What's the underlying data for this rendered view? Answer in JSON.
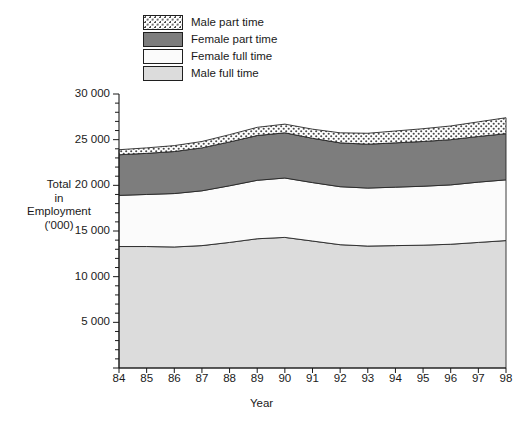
{
  "chart_data": {
    "type": "area",
    "stacked": true,
    "title": "",
    "xlabel": "Year",
    "ylabel": "Total in Employment ('000)",
    "ylabel_lines": [
      "Total",
      "in",
      "Employment",
      "('000)"
    ],
    "x": [
      84,
      85,
      86,
      87,
      88,
      89,
      90,
      91,
      92,
      93,
      94,
      95,
      96,
      97,
      98
    ],
    "x_tick_labels": [
      "84",
      "85",
      "86",
      "87",
      "88",
      "89",
      "90",
      "91",
      "92",
      "93",
      "94",
      "95",
      "96",
      "97",
      "98"
    ],
    "xlim": [
      84,
      98
    ],
    "ylim": [
      0,
      30000
    ],
    "y_ticks_major": [
      0,
      5000,
      10000,
      15000,
      20000,
      25000,
      30000
    ],
    "y_tick_labels": [
      "0",
      "5 000",
      "10 000",
      "15 000",
      "20 000",
      "25 000",
      "30 000"
    ],
    "y_minor_tick_step": 1000,
    "grid": false,
    "legend_position": "top-left-outside",
    "series": [
      {
        "name": "Male full time",
        "color": "#dcdcdc",
        "pattern": "solid",
        "values": [
          13300,
          13300,
          13250,
          13400,
          13750,
          14150,
          14300,
          13900,
          13500,
          13350,
          13400,
          13450,
          13550,
          13750,
          13950
        ]
      },
      {
        "name": "Female full time",
        "color": "#fbfbfb",
        "pattern": "solid",
        "values": [
          5600,
          5700,
          5850,
          6000,
          6200,
          6400,
          6500,
          6400,
          6350,
          6350,
          6400,
          6450,
          6500,
          6600,
          6650
        ]
      },
      {
        "name": "Female part time",
        "color": "#7d7d7d",
        "pattern": "solid",
        "values": [
          4450,
          4500,
          4600,
          4700,
          4800,
          4900,
          4950,
          4850,
          4800,
          4800,
          4850,
          4900,
          4950,
          5000,
          5050
        ]
      },
      {
        "name": "Male part time",
        "color": "#ffffff",
        "pattern": "dotted",
        "values": [
          550,
          600,
          650,
          700,
          800,
          900,
          950,
          1000,
          1100,
          1200,
          1300,
          1400,
          1500,
          1600,
          1750
        ]
      }
    ],
    "totals": [
      23900,
      24100,
      24350,
      24800,
      25550,
      26350,
      26700,
      26150,
      25750,
      25700,
      25950,
      26200,
      26500,
      26950,
      27400
    ]
  },
  "legend": {
    "items": [
      {
        "label": "Male part time",
        "swatch": "male-part-time-swatch"
      },
      {
        "label": "Female part time",
        "swatch": "female-part-time-swatch"
      },
      {
        "label": "Female full time",
        "swatch": "female-full-time-swatch"
      },
      {
        "label": "Male full time",
        "swatch": "male-full-time-swatch"
      }
    ]
  }
}
